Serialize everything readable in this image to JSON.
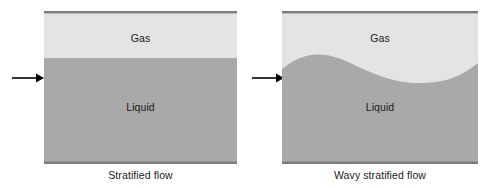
{
  "figure": {
    "width": 495,
    "height": 188,
    "background": "#ffffff",
    "colors": {
      "gas_fill": "#e4e4e4",
      "liquid_fill": "#a9a9a9",
      "border": "#7d7d7d",
      "arrow": "#000000",
      "text": "#1a1a1a"
    }
  },
  "panels": [
    {
      "id": "stratified-flow",
      "caption": "Stratified flow",
      "inlet_arrow": "arrow-right-icon",
      "interface": "flat",
      "gas": {
        "label": "Gas"
      },
      "liquid": {
        "label": "Liquid"
      }
    },
    {
      "id": "wavy-stratified-flow",
      "caption": "Wavy stratified flow",
      "inlet_arrow": "arrow-right-icon",
      "interface": "wavy",
      "gas": {
        "label": "Gas"
      },
      "liquid": {
        "label": "Liquid"
      }
    }
  ]
}
